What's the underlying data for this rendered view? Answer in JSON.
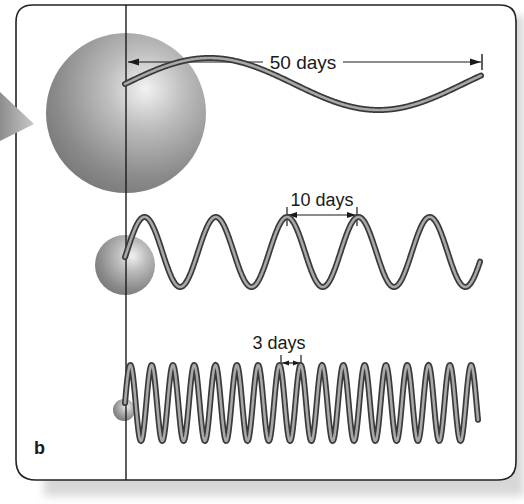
{
  "figure": {
    "panel_label": "b",
    "background": "#ffffff",
    "frame_color": "#222222",
    "wave_outer_color": "#3a3a3a",
    "wave_inner_color": "#a8a8a8",
    "sphere_color": "#8a8a8a"
  },
  "waves": [
    {
      "name": "large-star-wave",
      "period_label": "50 days",
      "period_days": 50,
      "peaks_visible": 1
    },
    {
      "name": "medium-star-wave",
      "period_label": "10 days",
      "period_days": 10,
      "peaks_visible": 5
    },
    {
      "name": "small-star-wave",
      "period_label": "3 days",
      "period_days": 3,
      "peaks_visible": 17
    }
  ],
  "spheres": [
    {
      "name": "large-sphere",
      "relative_size": "large"
    },
    {
      "name": "medium-sphere",
      "relative_size": "medium"
    },
    {
      "name": "small-sphere",
      "relative_size": "small"
    }
  ]
}
